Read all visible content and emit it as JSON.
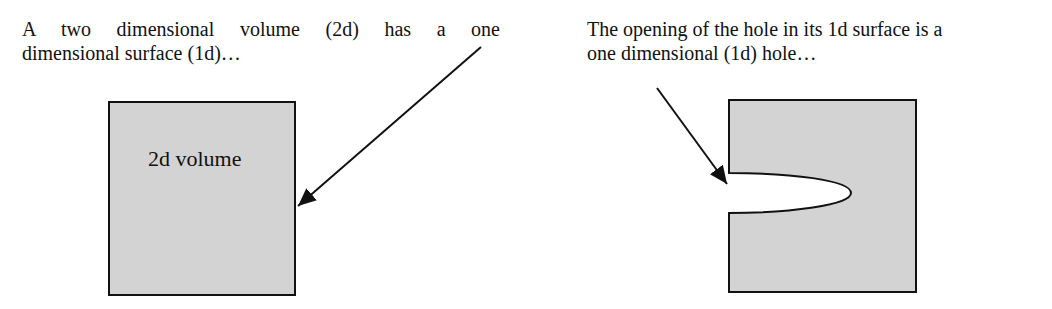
{
  "left_panel": {
    "caption_line1": "A two dimensional volume (2d) has a one",
    "caption_line2": "dimensional surface (1d)…",
    "shape_label": "2d volume"
  },
  "right_panel": {
    "caption_line1": "The opening of the hole in its 1d surface is a",
    "caption_line2": "one dimensional (1d) hole…"
  },
  "colors": {
    "fill": "#d3d3d3",
    "stroke": "#111111",
    "background": "#ffffff"
  }
}
